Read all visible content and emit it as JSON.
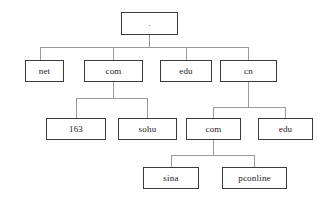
{
  "diagram": {
    "type": "tree",
    "colors": {
      "node_border": "#3a3a3a",
      "node_fill": "#ffffff",
      "edge": "#9a9a9a",
      "text": "#1a1a1a",
      "background": "#ffffff"
    },
    "levels": [
      {
        "index": 0,
        "name": "root"
      },
      {
        "index": 1,
        "name": "top-level-domains"
      },
      {
        "index": 2,
        "name": "second-level-domains"
      },
      {
        "index": 3,
        "name": "third-level-domains"
      }
    ],
    "nodes": [
      {
        "id": "root",
        "label": ".",
        "level": 0,
        "parent": null
      },
      {
        "id": "net",
        "label": "net",
        "level": 1,
        "parent": "root"
      },
      {
        "id": "com",
        "label": "com",
        "level": 1,
        "parent": "root"
      },
      {
        "id": "edu",
        "label": "edu",
        "level": 1,
        "parent": "root"
      },
      {
        "id": "cn",
        "label": "cn",
        "level": 1,
        "parent": "root"
      },
      {
        "id": "163",
        "label": "163",
        "level": 2,
        "parent": "com"
      },
      {
        "id": "sohu",
        "label": "sohu",
        "level": 2,
        "parent": "com"
      },
      {
        "id": "cn-com",
        "label": "com",
        "level": 2,
        "parent": "cn"
      },
      {
        "id": "cn-edu",
        "label": "edu",
        "level": 2,
        "parent": "cn"
      },
      {
        "id": "sina",
        "label": "sina",
        "level": 3,
        "parent": "cn-com"
      },
      {
        "id": "pconline",
        "label": "pconline",
        "level": 3,
        "parent": "cn-com"
      }
    ],
    "edges": [
      {
        "from": "root",
        "to": "net"
      },
      {
        "from": "root",
        "to": "com"
      },
      {
        "from": "root",
        "to": "edu"
      },
      {
        "from": "root",
        "to": "cn"
      },
      {
        "from": "com",
        "to": "163"
      },
      {
        "from": "com",
        "to": "sohu"
      },
      {
        "from": "cn",
        "to": "cn-com"
      },
      {
        "from": "cn",
        "to": "cn-edu"
      },
      {
        "from": "cn-com",
        "to": "sina"
      },
      {
        "from": "cn-com",
        "to": "pconline"
      }
    ]
  }
}
